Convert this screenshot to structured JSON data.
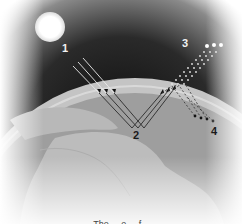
{
  "diagram": {
    "labels": {
      "incoming": "1",
      "surface": "2",
      "scattered": "3",
      "reflected": "4"
    },
    "caption": "The ... e ... f..."
  },
  "colors": {
    "space": "#1c1c1c",
    "sun": "#ffffff",
    "atmosphere": "#c9c9c9",
    "ocean": "#9a9a9a",
    "land": "#bdbdbd",
    "ray": "#2a2a2a"
  }
}
